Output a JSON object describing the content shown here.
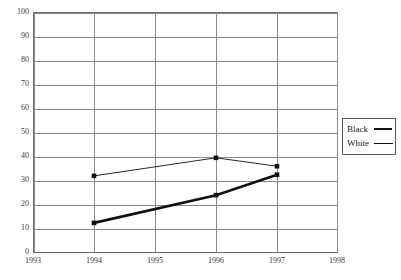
{
  "chart_data": {
    "type": "line",
    "title": "",
    "xlabel": "",
    "ylabel": "",
    "x": [
      1993,
      1994,
      1995,
      1996,
      1997,
      1998
    ],
    "xtick_labels": [
      "1993",
      "1994",
      "1995",
      "1996",
      "1997",
      "1998"
    ],
    "xlim": [
      1993,
      1998
    ],
    "ylim": [
      0,
      100
    ],
    "ytick_labels": [
      "100",
      "90",
      "80",
      "70",
      "60",
      "50",
      "40",
      "30",
      "20",
      "10",
      "0"
    ],
    "yticks": [
      100,
      90,
      80,
      70,
      60,
      50,
      40,
      30,
      20,
      10,
      0
    ],
    "grid": true,
    "legend_position": "right",
    "series": [
      {
        "name": "Black",
        "style": "thick",
        "color": "#111111",
        "marker": "square",
        "points": [
          {
            "x": 1994,
            "y": 12.5
          },
          {
            "x": 1996,
            "y": 24
          },
          {
            "x": 1997,
            "y": 32.5
          }
        ]
      },
      {
        "name": "White",
        "style": "thin",
        "color": "#111111",
        "marker": "square",
        "points": [
          {
            "x": 1994,
            "y": 32
          },
          {
            "x": 1996,
            "y": 39.5
          },
          {
            "x": 1997,
            "y": 36
          }
        ]
      }
    ]
  },
  "legend": {
    "items": [
      {
        "label": "Black",
        "swatch": "thick-line-swatch"
      },
      {
        "label": "White",
        "swatch": "thin-line-swatch"
      }
    ]
  },
  "axes": {
    "y_labels": [
      "100",
      "90",
      "80",
      "70",
      "60",
      "50",
      "40",
      "30",
      "20",
      "10",
      "0"
    ],
    "x_labels": [
      "1993",
      "1994",
      "1995",
      "1996",
      "1997",
      "1998"
    ]
  }
}
